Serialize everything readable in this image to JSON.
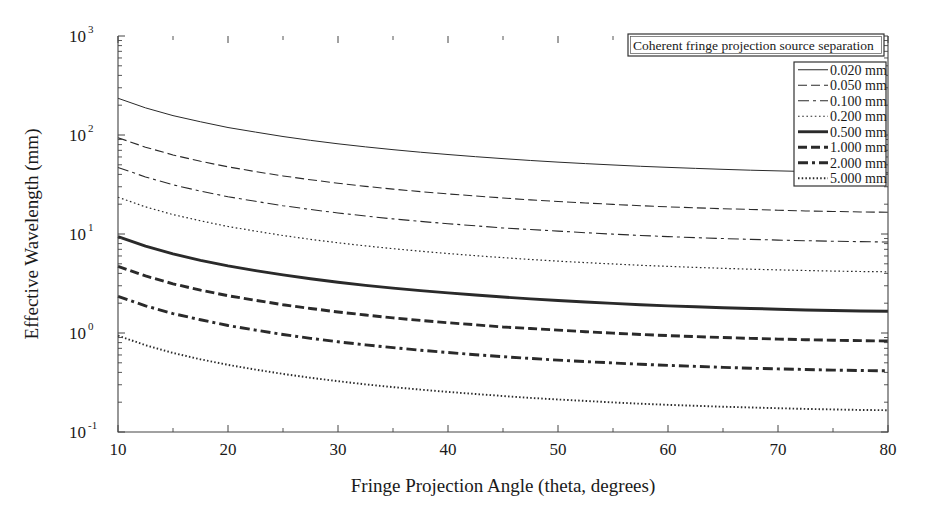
{
  "chart_data": {
    "type": "line",
    "title": "",
    "xlabel": "Fringe Projection Angle (theta, degrees)",
    "ylabel": "Effective Wavelength (mm)",
    "xscale": "linear",
    "yscale": "log",
    "xlim": [
      10,
      80
    ],
    "ylim": [
      0.1,
      1000
    ],
    "xticks": [
      10,
      20,
      30,
      40,
      50,
      60,
      70,
      80
    ],
    "xticklabels": [
      "10",
      "20",
      "30",
      "40",
      "50",
      "60",
      "70",
      "80"
    ],
    "yticks": [
      0.1,
      1,
      10,
      100,
      1000
    ],
    "yticklabels": [
      "10^-1",
      "10^0",
      "10^1",
      "10^2",
      "10^3"
    ],
    "ytick_mantissa": "10",
    "ytick_exponents": [
      "-1",
      "0",
      "1",
      "2",
      "3"
    ],
    "grid": false,
    "legend_position": "upper right",
    "legend_title": "Coherent fringe projection source separation",
    "x": [
      10,
      12.5,
      15,
      17.5,
      20,
      22.5,
      25,
      27.5,
      30,
      32.5,
      35,
      37.5,
      40,
      42.5,
      45,
      47.5,
      50,
      52.5,
      55,
      57.5,
      60,
      62.5,
      65,
      67.5,
      70,
      72.5,
      75,
      77.5,
      80
    ],
    "series": [
      {
        "name": "0.020 mm",
        "separation_mm": 0.02,
        "linestyle": "solid",
        "dash": "none",
        "width": 1.0,
        "color": "#2a2a2a",
        "values": [
          235,
          188,
          157,
          136,
          119,
          107,
          96.5,
          88.3,
          81.5,
          75.9,
          71.1,
          67.0,
          63.5,
          60.4,
          57.7,
          55.3,
          53.2,
          51.4,
          49.8,
          48.3,
          47.1,
          46.0,
          45.0,
          44.1,
          43.4,
          42.8,
          42.2,
          41.8,
          41.5
        ]
      },
      {
        "name": "0.050 mm",
        "separation_mm": 0.05,
        "linestyle": "dashed",
        "dash": "9,4",
        "width": 1.1,
        "color": "#2a2a2a",
        "values": [
          94.0,
          75.3,
          62.9,
          54.2,
          47.7,
          42.7,
          38.6,
          35.3,
          32.6,
          30.3,
          28.4,
          26.8,
          25.4,
          24.2,
          23.1,
          22.1,
          21.3,
          20.6,
          19.9,
          19.3,
          18.8,
          18.4,
          18.0,
          17.7,
          17.4,
          17.1,
          16.9,
          16.7,
          16.6
        ]
      },
      {
        "name": "0.100 mm",
        "separation_mm": 0.1,
        "linestyle": "dashdot",
        "dash": "11,4,3,4",
        "width": 1.1,
        "color": "#2a2a2a",
        "values": [
          47.0,
          37.7,
          31.4,
          27.1,
          23.8,
          21.4,
          19.3,
          17.7,
          16.3,
          15.2,
          14.2,
          13.4,
          12.7,
          12.1,
          11.5,
          11.1,
          10.7,
          10.3,
          9.96,
          9.67,
          9.41,
          9.19,
          9.0,
          8.83,
          8.68,
          8.56,
          8.45,
          8.37,
          8.3
        ]
      },
      {
        "name": "0.200 mm",
        "separation_mm": 0.2,
        "linestyle": "dotted",
        "dash": "1.6,2.6",
        "width": 1.2,
        "color": "#8c8c8c",
        "values": [
          23.5,
          18.8,
          15.7,
          13.6,
          11.9,
          10.7,
          9.65,
          8.83,
          8.15,
          7.59,
          7.11,
          6.7,
          6.35,
          6.04,
          5.77,
          5.53,
          5.32,
          5.14,
          4.98,
          4.83,
          4.71,
          4.6,
          4.5,
          4.41,
          4.34,
          4.28,
          4.22,
          4.18,
          4.15
        ]
      },
      {
        "name": "0.500 mm",
        "separation_mm": 0.5,
        "linestyle": "solid-bold",
        "dash": "none",
        "width": 2.9,
        "color": "#141414",
        "values": [
          9.4,
          7.53,
          6.29,
          5.42,
          4.77,
          4.27,
          3.86,
          3.53,
          3.26,
          3.03,
          2.84,
          2.68,
          2.54,
          2.42,
          2.31,
          2.21,
          2.13,
          2.06,
          1.99,
          1.93,
          1.88,
          1.84,
          1.8,
          1.77,
          1.74,
          1.71,
          1.69,
          1.67,
          1.66
        ]
      },
      {
        "name": "1.000 mm",
        "separation_mm": 1.0,
        "linestyle": "dashed-bold",
        "dash": "9,4",
        "width": 2.9,
        "color": "#141414",
        "values": [
          4.7,
          3.77,
          3.14,
          2.71,
          2.38,
          2.14,
          1.93,
          1.77,
          1.63,
          1.52,
          1.42,
          1.34,
          1.27,
          1.21,
          1.15,
          1.11,
          1.07,
          1.03,
          0.996,
          0.967,
          0.941,
          0.919,
          0.9,
          0.883,
          0.868,
          0.856,
          0.845,
          0.837,
          0.83
        ]
      },
      {
        "name": "2.000 mm",
        "separation_mm": 2.0,
        "linestyle": "dashdot-bold",
        "dash": "10,4,3,4",
        "width": 2.9,
        "color": "#141414",
        "values": [
          2.35,
          1.88,
          1.57,
          1.36,
          1.19,
          1.07,
          0.965,
          0.883,
          0.815,
          0.759,
          0.711,
          0.67,
          0.635,
          0.604,
          0.577,
          0.553,
          0.532,
          0.514,
          0.498,
          0.483,
          0.471,
          0.46,
          0.45,
          0.441,
          0.434,
          0.428,
          0.422,
          0.418,
          0.415
        ]
      },
      {
        "name": "5.000 mm",
        "separation_mm": 5.0,
        "linestyle": "dotted",
        "dash": "1.5,2.2",
        "width": 1.9,
        "color": "#6f6f6f",
        "values": [
          0.94,
          0.753,
          0.629,
          0.542,
          0.477,
          0.427,
          0.386,
          0.353,
          0.326,
          0.303,
          0.284,
          0.268,
          0.254,
          0.242,
          0.231,
          0.221,
          0.213,
          0.206,
          0.199,
          0.193,
          0.188,
          0.184,
          0.18,
          0.177,
          0.174,
          0.171,
          0.169,
          0.167,
          0.166
        ]
      }
    ]
  },
  "geometry": {
    "plot_left": 118,
    "plot_right": 888,
    "plot_top": 36,
    "plot_bottom": 432,
    "legend_title_box": {
      "x": 628,
      "y": 34,
      "w": 256,
      "h": 22
    },
    "legend_box": {
      "x": 794,
      "y": 62,
      "w": 92,
      "h": 124
    }
  }
}
